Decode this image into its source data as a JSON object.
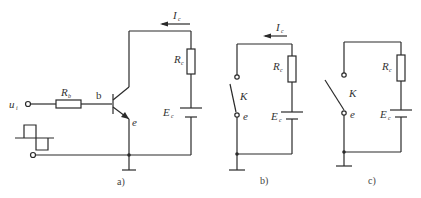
{
  "figure": {
    "panels": [
      {
        "caption": "a)",
        "labels": {
          "input": {
            "main": "u",
            "sub": "i"
          },
          "base_resistor": {
            "main": "R",
            "sub": "b"
          },
          "base": "b",
          "emitter": "e",
          "collector_resistor": {
            "main": "R",
            "sub": "c"
          },
          "supply": {
            "main": "E",
            "sub": "c"
          },
          "current": {
            "main": "I",
            "sub": "c"
          }
        }
      },
      {
        "caption": "b)",
        "labels": {
          "switch": "K",
          "emitter": "e",
          "collector_resistor": {
            "main": "R",
            "sub": "c"
          },
          "supply": {
            "main": "E",
            "sub": "c"
          },
          "current": {
            "main": "I",
            "sub": "c"
          }
        }
      },
      {
        "caption": "c)",
        "labels": {
          "switch": "K",
          "emitter": "e",
          "collector_resistor": {
            "main": "R",
            "sub": "c"
          },
          "supply": {
            "main": "E",
            "sub": "c"
          }
        }
      }
    ]
  }
}
